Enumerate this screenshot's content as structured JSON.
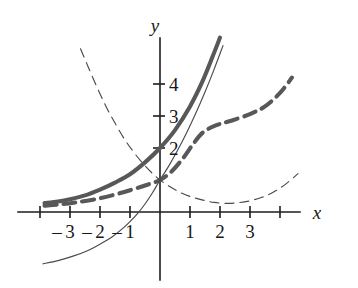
{
  "figure": {
    "background_color": "#ffffff"
  },
  "axes": {
    "x_axis_label": "x",
    "y_axis_label": "y",
    "x_axis_label_style": "italic",
    "y_axis_label_style": "italic",
    "axis_color": "#1d1d1d",
    "origin_px": {
      "x": 160,
      "y": 212
    },
    "unit_px": {
      "x": 30,
      "y": 32
    },
    "x_range": [
      -4.7,
      6.2
    ],
    "y_range": [
      -2.4,
      5.6
    ],
    "grid": false,
    "x_ticks": [
      {
        "value": -4,
        "label": ""
      },
      {
        "value": -3,
        "label": "3"
      },
      {
        "value": -2,
        "label": "2"
      },
      {
        "value": -1,
        "label": "1"
      },
      {
        "value": 1,
        "label": "1"
      },
      {
        "value": 2,
        "label": "2"
      },
      {
        "value": 3,
        "label": "3"
      },
      {
        "value": 4,
        "label": ""
      }
    ],
    "x_negative_sign_marks": [
      {
        "value": -3,
        "label": "–"
      },
      {
        "value": -2,
        "label": "–"
      },
      {
        "value": -1,
        "label": "–"
      }
    ],
    "y_ticks": [
      {
        "value": 2,
        "label": "2"
      },
      {
        "value": 3,
        "label": "3"
      },
      {
        "value": 4,
        "label": "4"
      }
    ]
  },
  "chart_data": {
    "type": "line",
    "title": "",
    "xlabel": "x",
    "ylabel": "y",
    "xlim": [
      -4.7,
      6.2
    ],
    "ylim": [
      -2.4,
      5.6
    ],
    "grid": false,
    "legend": "none",
    "series": [
      {
        "name": "thick-solid-growth",
        "style": "solid",
        "weight": "thick",
        "color": "#58585a",
        "y_intercept": 2,
        "description": "Thick gray solid increasing exponential curve passing through (0, 2)",
        "x": [
          -3.85,
          -3.4,
          -3.0,
          -2.5,
          -2.0,
          -1.5,
          -1.0,
          -0.5,
          0.0,
          0.5,
          1.0,
          1.4,
          1.75,
          2.0
        ],
        "y": [
          0.28,
          0.33,
          0.4,
          0.52,
          0.7,
          0.92,
          1.18,
          1.55,
          2.0,
          2.56,
          3.3,
          4.05,
          4.85,
          5.45
        ]
      },
      {
        "name": "thick-dashed-growth",
        "style": "dashed",
        "weight": "thick",
        "color": "#58585a",
        "y_intercept": 1,
        "description": "Thick gray dashed increasing curve through (0, 1) that flattens near x = 2 then rises",
        "x": [
          -3.85,
          -3.3,
          -2.8,
          -2.2,
          -1.6,
          -1.0,
          -0.5,
          0.0,
          0.4,
          0.8,
          1.1,
          1.45,
          1.9,
          2.4,
          3.0,
          3.5,
          4.0,
          4.4
        ],
        "y": [
          0.2,
          0.24,
          0.3,
          0.39,
          0.52,
          0.68,
          0.83,
          1.0,
          1.28,
          1.72,
          2.12,
          2.5,
          2.72,
          2.86,
          3.06,
          3.3,
          3.72,
          4.2
        ]
      },
      {
        "name": "thin-solid-logarithmic",
        "style": "solid",
        "weight": "thin",
        "color": "#4a4a4c",
        "description": "Thin black increasing curve crossing the x-axis near x = -1, steeply rising to the right of the origin",
        "x": [
          -3.9,
          -3.4,
          -2.9,
          -2.4,
          -1.95,
          -1.6,
          -1.25,
          -1.0,
          -0.75,
          -0.5,
          -0.25,
          0.0,
          0.3,
          0.6,
          0.9,
          1.2,
          1.5,
          1.8,
          2.1
        ],
        "y": [
          -1.62,
          -1.52,
          -1.38,
          -1.2,
          -0.98,
          -0.78,
          -0.52,
          -0.3,
          -0.05,
          0.25,
          0.6,
          1.0,
          1.45,
          1.95,
          2.5,
          3.1,
          3.75,
          4.45,
          5.2
        ]
      },
      {
        "name": "thin-dashed-decay",
        "style": "dashed",
        "weight": "thin",
        "color": "#4a4a4c",
        "description": "Thin black dashed decreasing curve from upper left through (0, 1), reaching a minimum near x = 2 then rising",
        "x": [
          -2.65,
          -2.4,
          -2.1,
          -1.8,
          -1.5,
          -1.2,
          -0.9,
          -0.6,
          -0.3,
          0.0,
          0.35,
          0.7,
          1.05,
          1.4,
          1.8,
          2.2,
          2.6,
          3.0,
          3.4,
          3.8,
          4.2,
          4.6
        ],
        "y": [
          5.1,
          4.55,
          3.9,
          3.3,
          2.78,
          2.3,
          1.9,
          1.55,
          1.25,
          1.0,
          0.78,
          0.6,
          0.47,
          0.38,
          0.3,
          0.27,
          0.29,
          0.35,
          0.46,
          0.63,
          0.88,
          1.2
        ]
      }
    ]
  }
}
